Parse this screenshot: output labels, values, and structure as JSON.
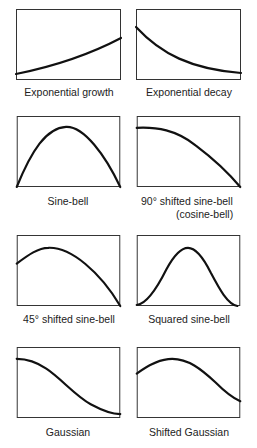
{
  "panels": [
    {
      "id": "exp-growth",
      "label": "Exponential growth"
    },
    {
      "id": "exp-decay",
      "label": "Exponential decay"
    },
    {
      "id": "sine-bell",
      "label": "Sine-bell"
    },
    {
      "id": "cosine-bell",
      "label": "90° shifted sine-bell",
      "sublabel": "(cosine-bell)"
    },
    {
      "id": "sine-bell-45",
      "label": "45° shifted sine-bell"
    },
    {
      "id": "squared-sine-bell",
      "label": "Squared sine-bell"
    },
    {
      "id": "gaussian",
      "label": "Gaussian"
    },
    {
      "id": "shifted-gaussian",
      "label": "Shifted Gaussian"
    }
  ],
  "colors": {
    "line": "#111111",
    "frame": "#333333",
    "text": "#222222",
    "background": "#ffffff"
  }
}
